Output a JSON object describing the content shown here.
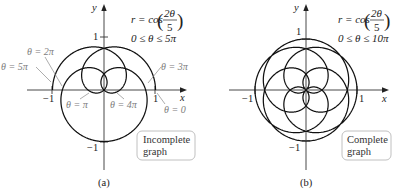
{
  "panels": [
    {
      "caption": "(a)",
      "equation": {
        "lhs": "r = cos",
        "open": "(",
        "numerator": "2θ",
        "denominator": "5",
        "close": ")"
      },
      "range": "0 ≤ θ ≤ 5π",
      "axis_labels": {
        "x": "x",
        "y": "y"
      },
      "ticks": {
        "x_neg": "−1",
        "x_pos": "1",
        "y_pos": "1",
        "y_neg": "−1"
      },
      "annotations": [
        "θ = 2π",
        "θ = 5π",
        "θ = 3π",
        "θ = π",
        "θ = 4π",
        "θ = 0"
      ],
      "box": {
        "line1": "Incomplete",
        "line2": "graph"
      }
    },
    {
      "caption": "(b)",
      "equation": {
        "lhs": "r = cos",
        "open": "(",
        "numerator": "2θ",
        "denominator": "5",
        "close": ")"
      },
      "range": "0 ≤ θ ≤ 10π",
      "axis_labels": {
        "x": "x",
        "y": "y"
      },
      "ticks": {
        "x_neg": "−1",
        "x_pos": "1",
        "y_pos": "1",
        "y_neg": "−1"
      },
      "box": {
        "line1": "Complete",
        "line2": "graph"
      }
    }
  ],
  "chart_data": [
    {
      "type": "line",
      "coordinate_system": "polar",
      "title": "r = cos(2θ/5), 0 ≤ θ ≤ 5π",
      "equation": "r = cos(2θ/5)",
      "coefficient": 0.4,
      "theta_min_pi": 0,
      "theta_max_pi": 5,
      "xlabel": "x",
      "ylabel": "y",
      "xlim": [
        -1,
        1
      ],
      "ylim": [
        -1,
        1
      ],
      "x_ticks": [
        -1,
        1
      ],
      "y_ticks": [
        -1,
        1
      ],
      "annotations": [
        {
          "text": "θ = 0",
          "point": [
            1,
            0
          ]
        },
        {
          "text": "θ = π",
          "point": [
            -0.309,
            0
          ]
        },
        {
          "text": "θ = 2π",
          "point": [
            -0.809,
            0
          ]
        },
        {
          "text": "θ = 3π",
          "point": [
            0.809,
            0
          ]
        },
        {
          "text": "θ = 4π",
          "point": [
            0.309,
            0
          ]
        },
        {
          "text": "θ = 5π",
          "point": [
            -1,
            0
          ]
        }
      ],
      "note": "Incomplete graph",
      "grid": false
    },
    {
      "type": "line",
      "coordinate_system": "polar",
      "title": "r = cos(2θ/5), 0 ≤ θ ≤ 10π",
      "equation": "r = cos(2θ/5)",
      "coefficient": 0.4,
      "theta_min_pi": 0,
      "theta_max_pi": 10,
      "xlabel": "x",
      "ylabel": "y",
      "xlim": [
        -1,
        1
      ],
      "ylim": [
        -1,
        1
      ],
      "x_ticks": [
        -1,
        1
      ],
      "y_ticks": [
        -1,
        1
      ],
      "note": "Complete graph",
      "grid": false
    }
  ]
}
